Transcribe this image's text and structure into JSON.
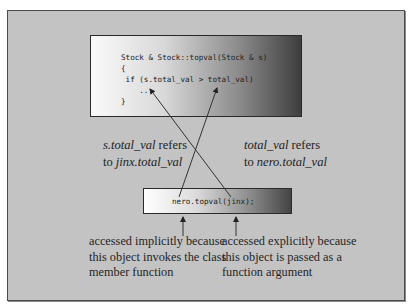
{
  "figure": {
    "top_code": {
      "lines": [
        "Stock & Stock::topval(Stock & s)",
        "{",
        " if (s.total_val > total_val)",
        "    ...",
        "}"
      ]
    },
    "bottom_code": {
      "line": "nero.topval(jinx);"
    },
    "left_label": {
      "line1_italic": "s.total_val",
      "line1_rest": " refers",
      "line2_prefix": "to ",
      "line2_italic": "jinx.total_val"
    },
    "right_label": {
      "line1_italic": "total_val",
      "line1_rest": " refers",
      "line2_prefix": "to ",
      "line2_italic": "nero.total_val"
    },
    "left_desc": [
      "accessed implicitly because",
      "this object invokes the class",
      "member function"
    ],
    "right_desc": [
      "accessed explicitly because",
      "this object is passed as a",
      "function argument"
    ],
    "colors": {
      "panel_bg": "#c3c3c3",
      "border": "#4a4a4a",
      "text": "#222222"
    }
  }
}
